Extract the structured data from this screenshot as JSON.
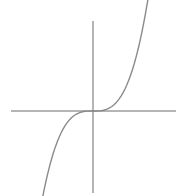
{
  "chart_data": {
    "type": "line",
    "title": "",
    "xlabel": "",
    "ylabel": "",
    "grid": false,
    "legend": null,
    "xlim": [
      -2.5,
      2.5
    ],
    "ylim": [
      -2.5,
      2.5
    ],
    "series": [
      {
        "name": "y = x^3",
        "function": "x^3",
        "x": [
          -2,
          -1.5,
          -1,
          -0.5,
          0,
          0.5,
          1,
          1.5,
          2
        ],
        "y": [
          -2,
          -0.84,
          -0.25,
          -0.03,
          0,
          0.03,
          0.25,
          0.84,
          2
        ]
      }
    ]
  },
  "colors": {
    "axis": "#6a6a6a",
    "curve": "#8a8a8a",
    "background": "#ffffff"
  }
}
